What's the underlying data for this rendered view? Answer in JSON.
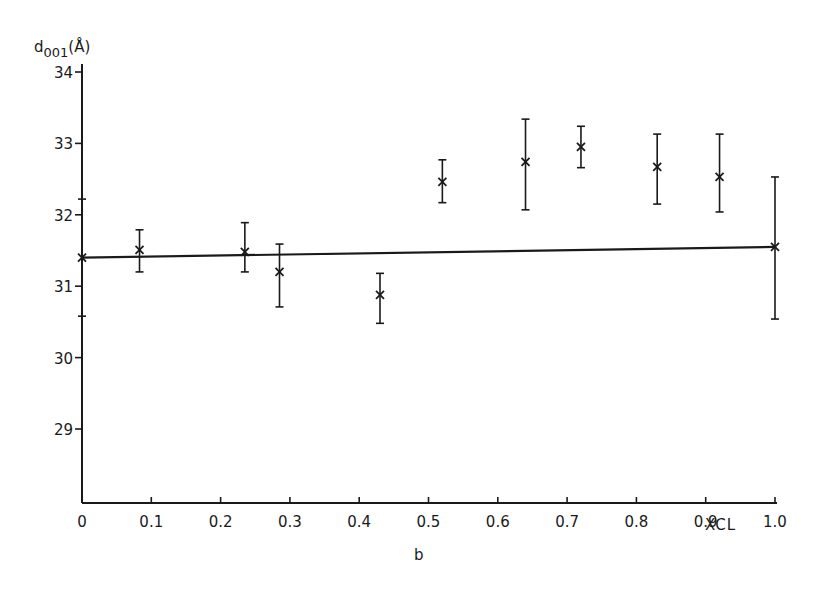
{
  "chart_data": {
    "type": "scatter",
    "title": "",
    "panel_label": "b",
    "xlabel": "XCL",
    "ylabel": "d001(Å)",
    "ylabel_parts": {
      "main": "d",
      "sub": "001",
      "unit": "(Å)"
    },
    "xlim": [
      0,
      1.0
    ],
    "ylim": [
      28,
      34
    ],
    "xticks": [
      0,
      0.1,
      0.2,
      0.3,
      0.4,
      0.5,
      0.6,
      0.7,
      0.8,
      0.9,
      1.0
    ],
    "xtick_labels": [
      "0",
      "0.1",
      "0.2",
      "0.3",
      "0.4",
      "0.5",
      "0.6",
      "0.7",
      "0.8",
      "0.9",
      "1.0"
    ],
    "yticks": [
      29,
      30,
      31,
      32,
      33,
      34
    ],
    "ytick_labels": [
      "29",
      "30",
      "31",
      "32",
      "33",
      "34"
    ],
    "grid": false,
    "legend": null,
    "series": [
      {
        "name": "measured d001",
        "marker": "x",
        "points": [
          {
            "x": 0.0,
            "y": 31.4,
            "y_low": 30.58,
            "y_high": 32.22
          },
          {
            "x": 0.083,
            "y": 31.51,
            "y_low": 31.2,
            "y_high": 31.79
          },
          {
            "x": 0.235,
            "y": 31.48,
            "y_low": 31.2,
            "y_high": 31.89
          },
          {
            "x": 0.285,
            "y": 31.2,
            "y_low": 30.71,
            "y_high": 31.59
          },
          {
            "x": 0.43,
            "y": 30.88,
            "y_low": 30.48,
            "y_high": 31.18
          },
          {
            "x": 0.52,
            "y": 32.46,
            "y_low": 32.17,
            "y_high": 32.77
          },
          {
            "x": 0.64,
            "y": 32.74,
            "y_low": 32.07,
            "y_high": 33.34
          },
          {
            "x": 0.72,
            "y": 32.95,
            "y_low": 32.66,
            "y_high": 33.24
          },
          {
            "x": 0.83,
            "y": 32.67,
            "y_low": 32.15,
            "y_high": 33.13
          },
          {
            "x": 0.92,
            "y": 32.53,
            "y_low": 32.04,
            "y_high": 33.13
          },
          {
            "x": 1.0,
            "y": 31.55,
            "y_low": 30.54,
            "y_high": 32.53
          }
        ]
      },
      {
        "name": "linear fit",
        "type": "line",
        "x": [
          0,
          1.0
        ],
        "values": [
          31.4,
          31.55
        ]
      }
    ]
  },
  "labels": {
    "panel": "b",
    "xaxis": "XCL",
    "yaxis_main": "d",
    "yaxis_sub": "001",
    "yaxis_unit": "(Å)"
  }
}
